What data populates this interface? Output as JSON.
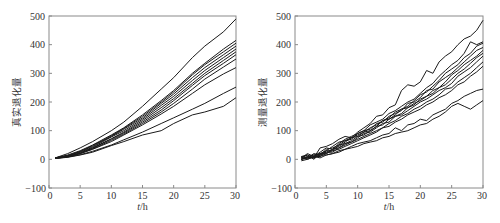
{
  "chart_data": [
    {
      "type": "line",
      "title": "",
      "xlabel": "t/h",
      "ylabel": "真实退化量",
      "xlim": [
        0,
        30
      ],
      "ylim": [
        -100,
        500
      ],
      "xticks": [
        0,
        5,
        10,
        15,
        20,
        25,
        30
      ],
      "yticks": [
        -100,
        0,
        100,
        200,
        300,
        400,
        500
      ],
      "grid": false,
      "legend": null,
      "x": [
        1,
        3,
        5,
        7,
        10,
        12,
        15,
        18,
        20,
        23,
        25,
        28,
        30
      ],
      "series": [
        {
          "name": "path 1",
          "values": [
            5,
            20,
            40,
            62,
            100,
            130,
            185,
            245,
            285,
            355,
            395,
            445,
            490
          ]
        },
        {
          "name": "path 2",
          "values": [
            5,
            15,
            30,
            50,
            85,
            110,
            155,
            205,
            240,
            300,
            335,
            385,
            415
          ]
        },
        {
          "name": "path 3",
          "values": [
            5,
            13,
            28,
            48,
            82,
            108,
            150,
            200,
            235,
            295,
            330,
            375,
            405
          ]
        },
        {
          "name": "path 4",
          "values": [
            5,
            12,
            27,
            45,
            80,
            105,
            145,
            195,
            228,
            285,
            320,
            365,
            395
          ]
        },
        {
          "name": "path 5",
          "values": [
            5,
            12,
            25,
            42,
            78,
            100,
            140,
            188,
            220,
            275,
            310,
            355,
            385
          ]
        },
        {
          "name": "path 6",
          "values": [
            4,
            10,
            22,
            40,
            72,
            95,
            135,
            180,
            212,
            265,
            300,
            345,
            375
          ]
        },
        {
          "name": "path 7",
          "values": [
            4,
            10,
            22,
            38,
            70,
            92,
            130,
            172,
            205,
            258,
            292,
            335,
            365
          ]
        },
        {
          "name": "path 8",
          "values": [
            4,
            9,
            20,
            36,
            66,
            88,
            125,
            165,
            195,
            245,
            280,
            322,
            350
          ]
        },
        {
          "name": "path 9",
          "values": [
            4,
            9,
            20,
            35,
            62,
            85,
            120,
            158,
            185,
            230,
            260,
            298,
            320
          ]
        },
        {
          "name": "path 10",
          "values": [
            3,
            8,
            16,
            28,
            50,
            68,
            95,
            125,
            145,
            175,
            195,
            230,
            252
          ]
        },
        {
          "name": "path 11",
          "values": [
            3,
            7,
            15,
            25,
            48,
            62,
            85,
            100,
            125,
            155,
            165,
            185,
            215
          ]
        }
      ]
    },
    {
      "type": "line",
      "title": "",
      "xlabel": "t/h",
      "ylabel": "测量退化量",
      "xlim": [
        0,
        30
      ],
      "ylim": [
        -100,
        500
      ],
      "xticks": [
        0,
        5,
        10,
        15,
        20,
        25,
        30
      ],
      "yticks": [
        -100,
        0,
        100,
        200,
        300,
        400,
        500
      ],
      "grid": false,
      "legend": null,
      "x": [
        1,
        2,
        3,
        4,
        5,
        6,
        7,
        8,
        9,
        10,
        11,
        12,
        13,
        14,
        15,
        16,
        17,
        18,
        19,
        20,
        21,
        22,
        23,
        24,
        25,
        26,
        27,
        28,
        29,
        30
      ],
      "series": [
        {
          "name": "path 1",
          "values": [
            10,
            15,
            5,
            40,
            45,
            55,
            70,
            80,
            75,
            95,
            110,
            125,
            150,
            155,
            180,
            190,
            240,
            260,
            255,
            270,
            310,
            300,
            340,
            360,
            375,
            400,
            420,
            430,
            450,
            485
          ]
        },
        {
          "name": "path 2",
          "values": [
            5,
            20,
            10,
            25,
            40,
            35,
            55,
            70,
            80,
            90,
            100,
            120,
            130,
            140,
            160,
            170,
            185,
            200,
            210,
            230,
            250,
            265,
            290,
            310,
            330,
            345,
            370,
            410,
            400,
            410
          ]
        },
        {
          "name": "path 3",
          "values": [
            0,
            10,
            15,
            20,
            30,
            45,
            60,
            65,
            75,
            85,
            95,
            110,
            120,
            135,
            145,
            165,
            175,
            185,
            205,
            225,
            235,
            255,
            275,
            300,
            315,
            330,
            355,
            370,
            395,
            405
          ]
        },
        {
          "name": "path 4",
          "values": [
            10,
            5,
            20,
            15,
            35,
            40,
            50,
            65,
            70,
            90,
            100,
            105,
            125,
            130,
            150,
            160,
            170,
            195,
            200,
            215,
            240,
            245,
            270,
            285,
            300,
            320,
            340,
            360,
            380,
            390
          ]
        },
        {
          "name": "path 5",
          "values": [
            5,
            15,
            0,
            20,
            25,
            35,
            45,
            60,
            75,
            80,
            95,
            100,
            115,
            135,
            140,
            155,
            175,
            180,
            190,
            210,
            220,
            240,
            250,
            270,
            295,
            310,
            330,
            345,
            360,
            380
          ]
        },
        {
          "name": "path 6",
          "values": [
            0,
            5,
            15,
            10,
            30,
            30,
            50,
            55,
            65,
            80,
            85,
            100,
            115,
            120,
            140,
            150,
            160,
            180,
            195,
            205,
            220,
            230,
            250,
            260,
            280,
            300,
            315,
            335,
            355,
            370
          ]
        },
        {
          "name": "path 7",
          "values": [
            5,
            0,
            10,
            20,
            20,
            35,
            40,
            55,
            60,
            75,
            90,
            95,
            110,
            125,
            130,
            150,
            155,
            170,
            185,
            200,
            210,
            225,
            240,
            250,
            265,
            290,
            305,
            320,
            340,
            360
          ]
        },
        {
          "name": "path 8",
          "values": [
            0,
            10,
            5,
            15,
            25,
            25,
            40,
            50,
            60,
            70,
            80,
            90,
            100,
            110,
            125,
            135,
            150,
            160,
            175,
            185,
            200,
            210,
            225,
            245,
            250,
            270,
            285,
            300,
            320,
            340
          ]
        },
        {
          "name": "path 9",
          "values": [
            5,
            5,
            10,
            10,
            20,
            30,
            35,
            45,
            55,
            65,
            75,
            85,
            95,
            110,
            115,
            130,
            140,
            155,
            165,
            175,
            190,
            200,
            215,
            225,
            240,
            260,
            270,
            290,
            305,
            325
          ]
        },
        {
          "name": "path 10",
          "values": [
            0,
            5,
            5,
            15,
            15,
            20,
            30,
            35,
            45,
            55,
            60,
            65,
            75,
            85,
            90,
            110,
            100,
            120,
            125,
            140,
            135,
            155,
            165,
            175,
            195,
            205,
            220,
            230,
            240,
            245
          ]
        },
        {
          "name": "path 11",
          "values": [
            -5,
            0,
            10,
            5,
            15,
            20,
            25,
            35,
            40,
            45,
            55,
            60,
            65,
            75,
            80,
            90,
            95,
            100,
            110,
            120,
            125,
            140,
            150,
            165,
            185,
            195,
            185,
            175,
            190,
            205
          ]
        }
      ]
    }
  ],
  "panels": [
    {
      "ylabel": "真实退化量",
      "xlabel_italic": "t",
      "xlabel_unit": "/h",
      "ytick_labels": [
        "500",
        "400",
        "300",
        "200",
        "100",
        "0",
        "−100"
      ],
      "xtick_labels": [
        "0",
        "5",
        "10",
        "15",
        "20",
        "25",
        "30"
      ]
    },
    {
      "ylabel": "测量退化量",
      "xlabel_italic": "t",
      "xlabel_unit": "/h",
      "ytick_labels": [
        "500",
        "400",
        "300",
        "200",
        "100",
        "0",
        "−100"
      ],
      "xtick_labels": [
        "0",
        "5",
        "10",
        "15",
        "20",
        "25",
        "30"
      ]
    }
  ]
}
